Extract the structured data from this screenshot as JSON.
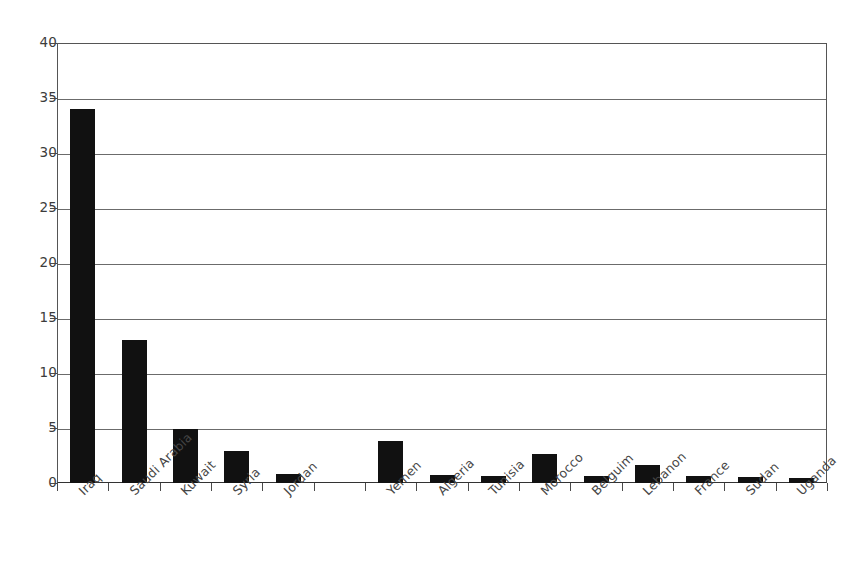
{
  "chart_data": {
    "type": "bar",
    "title": "",
    "subtitle": "",
    "xlabel": "",
    "ylabel": "",
    "ylim": [
      0,
      40
    ],
    "ytick_step": 5,
    "yticks": [
      0,
      5,
      10,
      15,
      20,
      25,
      30,
      35,
      40
    ],
    "ytick_labels": [
      "0",
      "5",
      "10",
      "15",
      "20",
      "25",
      "30",
      "35",
      "40"
    ],
    "grid": true,
    "grid_axis": "y",
    "legend": false,
    "legend_position": "none",
    "bar_color": "#111111",
    "categories": [
      "Iraq",
      "Saudi Arabia",
      "Kuwait",
      "Syria",
      "Jordan",
      "",
      "Yemen",
      "Algeria",
      "Tunisia",
      "Morocco",
      "Belguim",
      "Lebanon",
      "France",
      "Sudan",
      "Uganda"
    ],
    "values": [
      34,
      13,
      4.9,
      2.9,
      0.8,
      0,
      3.8,
      0.7,
      0.6,
      2.6,
      0.6,
      1.6,
      0.6,
      0.55,
      0.5
    ],
    "annotations": []
  },
  "colors": {
    "bar": "#111111",
    "axis": "#4a4a4a",
    "grid": "#6b6b6b",
    "text": "#3c3c3c",
    "background": "#ffffff"
  }
}
